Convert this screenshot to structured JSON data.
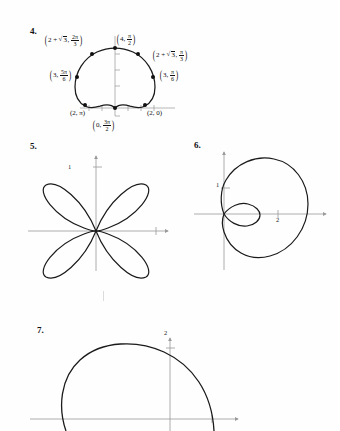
{
  "page": {
    "background_color": "#fefefe",
    "ink_color": "#111111",
    "axis_color": "#8a8a8a",
    "curve_color": "#1a1a1a",
    "type": "textbook-answer-figures",
    "width": 340,
    "height": 431
  },
  "problems": [
    {
      "number": "4.",
      "curve_type": "cardioid",
      "equation_implied": "r = 2 + 2 sin(theta)",
      "labels": [
        {
          "id": "pt-2pi-3",
          "r_text": "2 + √3",
          "theta_num": "2π",
          "theta_den": "3",
          "display": "(2 + √3, 2π/3)"
        },
        {
          "id": "pt-pi-2",
          "r_text": "4",
          "theta_num": "π",
          "theta_den": "2",
          "display": "(4, π/2)"
        },
        {
          "id": "pt-pi-3",
          "r_text": "2 + √3",
          "theta_num": "π",
          "theta_den": "3",
          "display": "(2 + √3, π/3)"
        },
        {
          "id": "pt-5pi-6",
          "r_text": "3",
          "theta_num": "5π",
          "theta_den": "6",
          "display": "(3, 5π/6)"
        },
        {
          "id": "pt-pi-6",
          "r_text": "3",
          "theta_num": "π",
          "theta_den": "6",
          "display": "(3, π/6)"
        },
        {
          "id": "pt-pi",
          "display": "(2, π)"
        },
        {
          "id": "pt-0",
          "display": "(2, 0)"
        },
        {
          "id": "pt-3pi-2",
          "r_text": "0",
          "theta_num": "3π",
          "theta_den": "2",
          "display": "(0, 3π/2)"
        }
      ]
    },
    {
      "number": "5.",
      "curve_type": "four-petaled-rose",
      "equation_implied": "r = a sin(2 theta)",
      "axis_ticks": {
        "y": "1"
      }
    },
    {
      "number": "6.",
      "curve_type": "limacon-with-inner-loop",
      "axis_ticks": {
        "y": "1",
        "x": "2"
      }
    },
    {
      "number": "7.",
      "curve_type": "circle-arc",
      "axis_ticks": {
        "y": "2"
      }
    }
  ]
}
